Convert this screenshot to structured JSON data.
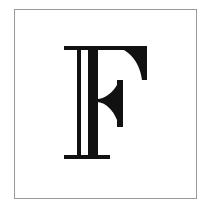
{
  "image": {
    "letter": "F",
    "description": "Decorative inline serif capital letter inside a square frame",
    "colors": {
      "background": "#ffffff",
      "frame": "#9a9a9a",
      "ink": "#111111"
    }
  }
}
